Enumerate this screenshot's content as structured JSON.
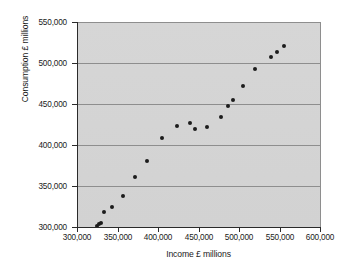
{
  "chart_data": {
    "type": "scatter",
    "title": "",
    "xlabel": "Income £ millions",
    "ylabel": "Consumption £ millions",
    "xlim": [
      300000,
      600000
    ],
    "ylim": [
      300000,
      550000
    ],
    "xticks": [
      300000,
      350000,
      400000,
      450000,
      500000,
      550000,
      600000
    ],
    "yticks": [
      300000,
      350000,
      400000,
      450000,
      500000,
      550000
    ],
    "xticklabels": [
      "300,000",
      "350,000",
      "400,000",
      "450,000",
      "500,000",
      "550,000",
      "600,000"
    ],
    "yticklabels": [
      "300,000",
      "350,000",
      "400,000",
      "450,000",
      "500,000",
      "550,000"
    ],
    "grid": "horizontal",
    "legend": "none",
    "plot_background_color": "#d4d4d4",
    "gridline_color": "#8e8e8e",
    "marker_color": "#1c1c1c",
    "points": [
      {
        "x": 325000,
        "y": 301500
      },
      {
        "x": 327000,
        "y": 303500
      },
      {
        "x": 330000,
        "y": 305000
      },
      {
        "x": 333000,
        "y": 318000
      },
      {
        "x": 343000,
        "y": 325000
      },
      {
        "x": 357000,
        "y": 337500
      },
      {
        "x": 372000,
        "y": 361000
      },
      {
        "x": 386000,
        "y": 380500
      },
      {
        "x": 405000,
        "y": 409000
      },
      {
        "x": 424000,
        "y": 423500
      },
      {
        "x": 439000,
        "y": 427000
      },
      {
        "x": 446000,
        "y": 419500
      },
      {
        "x": 461000,
        "y": 421500
      },
      {
        "x": 478000,
        "y": 434500
      },
      {
        "x": 486000,
        "y": 447500
      },
      {
        "x": 493000,
        "y": 455000
      },
      {
        "x": 505000,
        "y": 471500
      },
      {
        "x": 520000,
        "y": 492500
      },
      {
        "x": 540000,
        "y": 507500
      },
      {
        "x": 547000,
        "y": 513000
      },
      {
        "x": 556000,
        "y": 521000
      }
    ]
  }
}
